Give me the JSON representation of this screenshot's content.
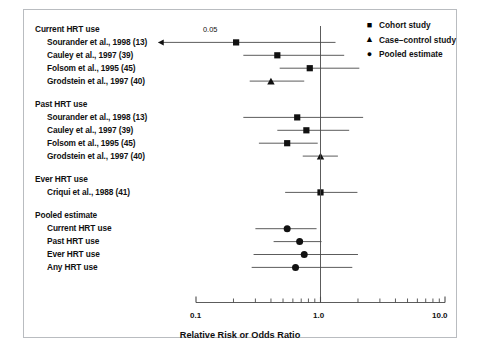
{
  "chart_data": {
    "type": "forest",
    "title": "",
    "xlabel": "Relative Risk or Odds Ratio",
    "ylabel": "",
    "xscale": "log",
    "xlim": [
      0.1,
      10.0
    ],
    "xticks_labeled": [
      "0.1",
      "1.0",
      "10.0"
    ],
    "xtick_values": [
      0.1,
      1.0,
      10.0
    ],
    "null_line": 1.0,
    "grid": false,
    "legend_position": "top-right",
    "legend": [
      {
        "label": "Cohort study",
        "marker": "square"
      },
      {
        "label": "Case–control study",
        "marker": "triangle"
      },
      {
        "label": "Pooled estimate",
        "marker": "circle"
      }
    ],
    "clipped_annotation": "0.05",
    "groups": [
      {
        "heading": "Current HRT use",
        "rows": [
          {
            "label": "Sourander et al., 1998 (13)",
            "marker": "square",
            "estimate": 0.21,
            "ci_low": 0.05,
            "ci_high": 1.32,
            "ci_low_clipped": true
          },
          {
            "label": "Cauley et al., 1997 (39)",
            "marker": "square",
            "estimate": 0.45,
            "ci_low": 0.24,
            "ci_high": 1.55,
            "ci_low_clipped": false
          },
          {
            "label": "Folsom et al., 1995 (45)",
            "marker": "square",
            "estimate": 0.82,
            "ci_low": 0.47,
            "ci_high": 2.05,
            "ci_low_clipped": false
          },
          {
            "label": "Grodstein et al., 1997 (40)",
            "marker": "triangle",
            "estimate": 0.4,
            "ci_low": 0.27,
            "ci_high": 0.74,
            "ci_low_clipped": false
          }
        ]
      },
      {
        "heading": "Past HRT use",
        "rows": [
          {
            "label": "Sourander et al., 1998 (13)",
            "marker": "square",
            "estimate": 0.65,
            "ci_low": 0.24,
            "ci_high": 2.2,
            "ci_low_clipped": false
          },
          {
            "label": "Cauley et al., 1997 (39)",
            "marker": "square",
            "estimate": 0.77,
            "ci_low": 0.45,
            "ci_high": 1.7,
            "ci_low_clipped": false
          },
          {
            "label": "Folsom et al., 1995 (45)",
            "marker": "square",
            "estimate": 0.54,
            "ci_low": 0.32,
            "ci_high": 0.95,
            "ci_low_clipped": false
          },
          {
            "label": "Grodstein et al., 1997 (40)",
            "marker": "triangle",
            "estimate": 1.0,
            "ci_low": 0.72,
            "ci_high": 1.38,
            "ci_low_clipped": false
          }
        ]
      },
      {
        "heading": "Ever HRT use",
        "rows": [
          {
            "label": "Criqui et al., 1988 (41)",
            "marker": "square",
            "estimate": 1.0,
            "ci_low": 0.52,
            "ci_high": 1.98,
            "ci_low_clipped": false
          }
        ]
      },
      {
        "heading": "Pooled estimate",
        "rows": [
          {
            "label": "Current HRT use",
            "marker": "circle",
            "estimate": 0.54,
            "ci_low": 0.3,
            "ci_high": 0.93,
            "ci_low_clipped": false
          },
          {
            "label": "Past HRT use",
            "marker": "circle",
            "estimate": 0.68,
            "ci_low": 0.42,
            "ci_high": 1.02,
            "ci_low_clipped": false
          },
          {
            "label": "Ever HRT use",
            "marker": "circle",
            "estimate": 0.74,
            "ci_low": 0.29,
            "ci_high": 2.0,
            "ci_low_clipped": false
          },
          {
            "label": "Any HRT use",
            "marker": "circle",
            "estimate": 0.63,
            "ci_low": 0.28,
            "ci_high": 1.8,
            "ci_low_clipped": false
          }
        ]
      }
    ]
  },
  "axis": {
    "title": "Relative Risk or Odds Ratio",
    "tick_left": "0.1",
    "tick_mid": "1.0",
    "tick_right": "10.0"
  },
  "annotation": {
    "clip_value": "0.05"
  },
  "legend": {
    "items": [
      {
        "label": "Cohort study"
      },
      {
        "label": "Case–control study"
      },
      {
        "label": "Pooled estimate"
      }
    ]
  },
  "colors": {
    "ink": "#111111",
    "rule": "#4a4a4a",
    "frame": "#b9bcc0",
    "background": "#ffffff"
  }
}
